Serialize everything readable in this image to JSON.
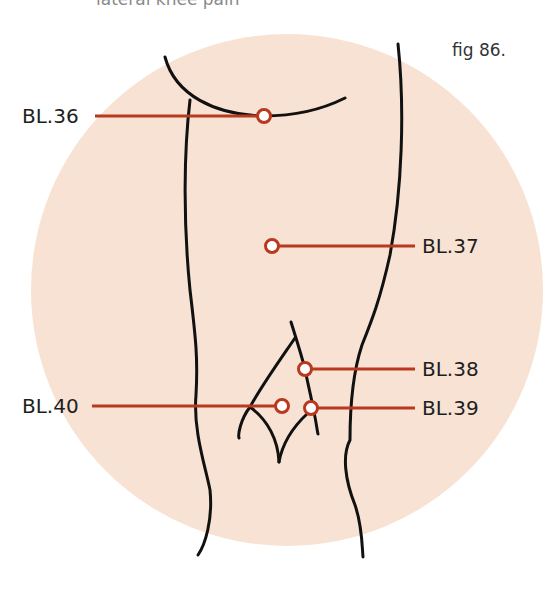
{
  "caption": {
    "text_dark": "p",
    "text_dark2": "p",
    "text_muted": "lateral knee pain",
    "note": "top caption line partially cut off"
  },
  "figure": {
    "label": "fig 86."
  },
  "colors": {
    "background_circle": "#f8e2d3",
    "outline": "#111111",
    "leader_line": "#b8391f",
    "marker_stroke": "#b8391f",
    "marker_fill": "#ffffff",
    "label_text": "#1e1e1e"
  },
  "points": [
    {
      "id": "BL.36",
      "label": "BL.36",
      "marker": [
        264,
        116
      ],
      "line_from": 95,
      "line_to": 258,
      "label_side": "left",
      "label_x": 22,
      "label_y": 106
    },
    {
      "id": "BL.37",
      "label": "BL.37",
      "marker": [
        272,
        246
      ],
      "line_from": 278,
      "line_to": 415,
      "label_side": "right",
      "label_x": 422,
      "label_y": 236
    },
    {
      "id": "BL.38",
      "label": "BL.38",
      "marker": [
        305,
        369
      ],
      "line_from": 311,
      "line_to": 415,
      "label_side": "right",
      "label_x": 422,
      "label_y": 359
    },
    {
      "id": "BL.39",
      "label": "BL.39",
      "marker": [
        311,
        408
      ],
      "line_from": 317,
      "line_to": 415,
      "label_side": "right",
      "label_x": 422,
      "label_y": 398
    },
    {
      "id": "BL.40",
      "label": "BL.40",
      "marker": [
        282,
        406
      ],
      "line_from": 92,
      "line_to": 276,
      "label_side": "left",
      "label_x": 22,
      "label_y": 396
    }
  ]
}
